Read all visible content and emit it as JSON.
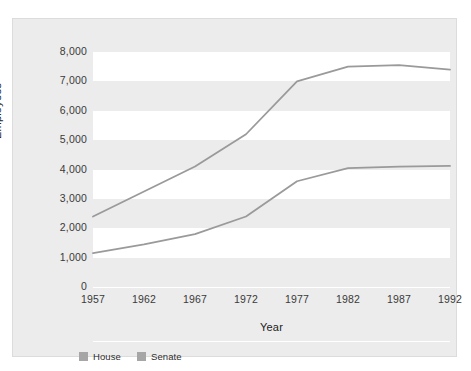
{
  "caption": {
    "text": ""
  },
  "colors": {
    "page_background": "#ffffff",
    "panel_background": "#ececec",
    "band_background": "#ffffff",
    "line_house": "#9a9a9a",
    "line_senate": "#9a9a9a",
    "legend_swatch_house": "#a6a6a6",
    "legend_swatch_senate": "#a6a6a6",
    "tick_text": "#3a3a3a",
    "axis_title_text": "#222222"
  },
  "legend": {
    "position": "bottom-left",
    "items": [
      {
        "label": "House",
        "color": "#a6a6a6"
      },
      {
        "label": "Senate",
        "color": "#a6a6a6"
      }
    ]
  },
  "chart_data": {
    "type": "line",
    "title": "",
    "xlabel": "Year",
    "ylabel": "Employees",
    "x": [
      1957,
      1962,
      1967,
      1972,
      1977,
      1982,
      1987,
      1992
    ],
    "categories": [
      "1957",
      "1962",
      "1967",
      "1972",
      "1977",
      "1982",
      "1987",
      "1992"
    ],
    "xlim": [
      1957,
      1992
    ],
    "ylim": [
      0,
      8000
    ],
    "ytick_labels": [
      "8,000",
      "7,000",
      "6,000",
      "5,000",
      "4,000",
      "3,000",
      "2,000",
      "1,000",
      "0"
    ],
    "ytick_values": [
      8000,
      7000,
      6000,
      5000,
      4000,
      3000,
      2000,
      1000,
      0
    ],
    "grid": "horizontal-bands",
    "legend_position": "bottom-left",
    "series": [
      {
        "name": "House",
        "color": "#9a9a9a",
        "values": [
          2400,
          3250,
          4100,
          5200,
          7000,
          7500,
          7550,
          7400
        ]
      },
      {
        "name": "Senate",
        "color": "#9a9a9a",
        "values": [
          1150,
          1450,
          1800,
          2400,
          3600,
          4050,
          4100,
          4120
        ]
      }
    ]
  }
}
